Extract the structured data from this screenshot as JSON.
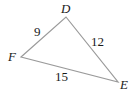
{
  "diagram": {
    "type": "triangle",
    "stroke_color": "#9a9a9a",
    "vertices": [
      {
        "name": "D",
        "x": 66,
        "y": 17,
        "label_x": 63,
        "label_y": 14
      },
      {
        "name": "E",
        "x": 118,
        "y": 82,
        "label_x": 120,
        "label_y": 88
      },
      {
        "name": "F",
        "x": 21,
        "y": 57,
        "label_x": 10,
        "label_y": 61
      }
    ],
    "sides": [
      {
        "from": "D",
        "to": "F",
        "length": "9",
        "label_x": 33,
        "label_y": 36
      },
      {
        "from": "D",
        "to": "E",
        "length": "12",
        "label_x": 92,
        "label_y": 46
      },
      {
        "from": "F",
        "to": "E",
        "length": "15",
        "label_x": 56,
        "label_y": 81
      }
    ]
  }
}
